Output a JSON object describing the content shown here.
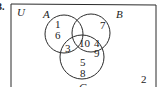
{
  "problem_number": "3.",
  "universe": {
    "label": "U"
  },
  "sets": [
    {
      "label": "A",
      "cx": 64,
      "cy": 34,
      "r": 19
    },
    {
      "label": "B",
      "cx": 91,
      "cy": 33,
      "r": 19
    },
    {
      "label": "C",
      "cx": 82,
      "cy": 57,
      "r": 22
    }
  ],
  "regions": {
    "A_only": [
      "1",
      "6"
    ],
    "B_only": [
      "7"
    ],
    "C_only": [
      "5",
      "8"
    ],
    "A_and_C_only": [
      "3"
    ],
    "A_and_B_and_C": [
      "10"
    ],
    "B_and_C_only": [
      "4",
      "9"
    ],
    "outside": [
      "2"
    ]
  },
  "text": {
    "n1": "1",
    "n6": "6",
    "n7": "7",
    "n3": "3",
    "n10": "10",
    "n4": "4",
    "n9": "9",
    "n5": "5",
    "n8": "8",
    "n2": "2",
    "U": "U",
    "A": "A",
    "B": "B",
    "C": "C",
    "prob": "3."
  },
  "colors": {
    "stroke": "#2a2a2a",
    "background": "#ffffff"
  }
}
